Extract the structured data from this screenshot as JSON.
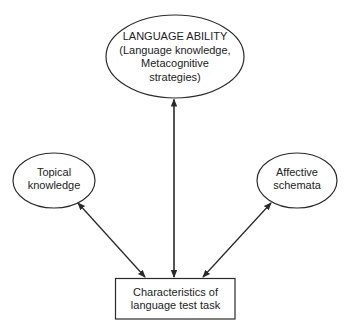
{
  "diagram": {
    "nodes": {
      "language_ability": {
        "shape": "ellipse",
        "lines": [
          "LANGUAGE ABILITY",
          "(Language knowledge,",
          "Metacognitive",
          "strategies)"
        ]
      },
      "topical_knowledge": {
        "shape": "ellipse",
        "lines": [
          "Topical",
          "knowledge"
        ]
      },
      "affective_schemata": {
        "shape": "ellipse",
        "lines": [
          "Affective",
          "schemata"
        ]
      },
      "test_task": {
        "shape": "rectangle",
        "lines": [
          "Characteristics of",
          "language test task"
        ]
      }
    },
    "edges": [
      {
        "from": "language_ability",
        "to": "test_task",
        "direction": "both"
      },
      {
        "from": "topical_knowledge",
        "to": "test_task",
        "direction": "both"
      },
      {
        "from": "affective_schemata",
        "to": "test_task",
        "direction": "both"
      }
    ],
    "colors": {
      "stroke": "#2a2a2a",
      "background": "#ffffff"
    }
  }
}
